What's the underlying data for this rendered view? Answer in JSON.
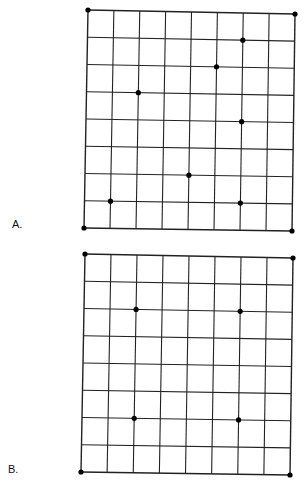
{
  "figures": [
    {
      "label": "A.",
      "grid_size": 8,
      "corners": {
        "tl": [
          88,
          10
        ],
        "tr": [
          295,
          14
        ],
        "bl": [
          84,
          228
        ],
        "br": [
          292,
          231
        ]
      },
      "dots": [
        [
          0,
          0
        ],
        [
          8,
          0
        ],
        [
          0,
          8
        ],
        [
          8,
          8
        ],
        [
          6,
          1
        ],
        [
          5,
          2
        ],
        [
          2,
          3
        ],
        [
          6,
          4
        ],
        [
          4,
          6
        ],
        [
          1,
          7
        ],
        [
          6,
          7
        ]
      ]
    },
    {
      "label": "B.",
      "grid_size": 8,
      "corners": {
        "tl": [
          85,
          254
        ],
        "tr": [
          293,
          258
        ],
        "bl": [
          81,
          472
        ],
        "br": [
          290,
          475
        ]
      },
      "dots": [
        [
          0,
          0
        ],
        [
          8,
          0
        ],
        [
          0,
          8
        ],
        [
          8,
          8
        ],
        [
          2,
          2
        ],
        [
          6,
          2
        ],
        [
          2,
          6
        ],
        [
          6,
          6
        ]
      ]
    }
  ],
  "style": {
    "line_color": "#222222",
    "dot_color": "#000000"
  }
}
